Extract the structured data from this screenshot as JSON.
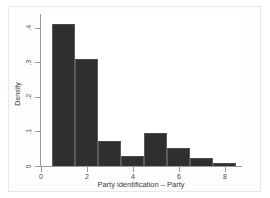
{
  "chart_data": {
    "type": "bar",
    "title": "",
    "subtitle": "",
    "xlabel": "Party identification – Party",
    "ylabel": "Density",
    "grid": false,
    "legend": null,
    "xlim": [
      0,
      8.7
    ],
    "ylim": [
      0,
      0.44
    ],
    "bin_width": 1,
    "bin_edges": [
      0.5,
      1.5,
      2.5,
      3.5,
      4.5,
      5.5,
      6.5,
      7.5,
      8.5
    ],
    "categories": [
      "1",
      "2",
      "3",
      "4",
      "5",
      "6",
      "7",
      "8"
    ],
    "values": [
      0.41,
      0.31,
      0.072,
      0.028,
      0.095,
      0.053,
      0.022,
      0.009
    ],
    "xticks": [
      0,
      2,
      4,
      6,
      8
    ],
    "xtick_labels": [
      "0",
      "2",
      "4",
      "6",
      "8"
    ],
    "yticks": [
      0,
      0.1,
      0.2,
      0.3,
      0.4
    ],
    "ytick_labels": [
      "0",
      ".1",
      ".2",
      ".3",
      ".4"
    ],
    "bar_color": "#2f2f2f",
    "bar_edge_color": "#5a5a5a",
    "plot_background": "#ffffff",
    "figure_background": "#fdfdfd",
    "axis_color": "#9a9a9a"
  }
}
